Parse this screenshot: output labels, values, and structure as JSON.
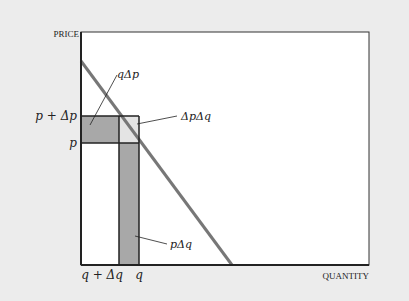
{
  "diagram": {
    "axes": {
      "y_label": "PRICE",
      "x_label": "QUANTITY"
    },
    "price_ticks": [
      {
        "label": "p + Δp",
        "y": 116
      },
      {
        "label": "p",
        "y": 143
      }
    ],
    "quantity_ticks": [
      {
        "label": "q + Δq",
        "x": 119
      },
      {
        "label": "q",
        "x": 139
      }
    ],
    "annotations": {
      "q_delta_p": "qΔp",
      "delta_p_delta_q": "ΔpΔq",
      "p_delta_q": "pΔq"
    },
    "colors": {
      "background": "#ececec",
      "plot_bg": "#ffffff",
      "dark_region": "#a8a8a8",
      "light_region": "#e4e4e4",
      "demand_line": "#777777",
      "axis": "#222222"
    }
  }
}
